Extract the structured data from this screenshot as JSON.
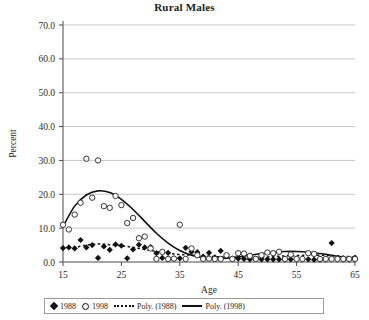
{
  "chart_data": {
    "type": "scatter",
    "title": "Rural Males",
    "xlabel": "Age",
    "ylabel": "Percent",
    "xlim": [
      15,
      65
    ],
    "ylim": [
      0,
      70
    ],
    "xticks": [
      15,
      25,
      35,
      45,
      55,
      65
    ],
    "yticks": [
      "0.0",
      "10.0",
      "20.0",
      "30.0",
      "40.0",
      "50.0",
      "60.0",
      "70.0"
    ],
    "grid": "horizontal",
    "legend_position": "bottom",
    "legend": [
      {
        "label": "1988",
        "marker": "filled-diamond"
      },
      {
        "label": "1998",
        "marker": "open-circle"
      },
      {
        "label": "Poly. (1988)",
        "marker": "dotted-line"
      },
      {
        "label": "Poly. (1998)",
        "marker": "solid-line"
      }
    ],
    "series": [
      {
        "name": "1988",
        "marker": "filled-diamond",
        "x": [
          15,
          16,
          17,
          18,
          19,
          20,
          21,
          22,
          23,
          24,
          25,
          26,
          27,
          28,
          29,
          30,
          31,
          32,
          33,
          34,
          35,
          36,
          37,
          38,
          39,
          40,
          41,
          42,
          43,
          44,
          45,
          46,
          47,
          48,
          49,
          50,
          51,
          52,
          53,
          54,
          55,
          56,
          57,
          58,
          59,
          60,
          61,
          62,
          63,
          64,
          65
        ],
        "y": [
          4.1,
          4.3,
          4.0,
          6.5,
          4.3,
          5.0,
          1.2,
          4.6,
          3.6,
          5.2,
          4.8,
          1.1,
          3.7,
          5.1,
          4.3,
          4.4,
          2.6,
          1.2,
          2.7,
          1.0,
          1.1,
          4.2,
          3.0,
          2.9,
          1.6,
          2.7,
          1.4,
          3.3,
          1.7,
          1.0,
          1.0,
          0.9,
          0.8,
          0.9,
          0.8,
          0.8,
          0.8,
          0.8,
          0.8,
          0.8,
          0.8,
          0.8,
          0.8,
          0.7,
          0.7,
          0.8,
          5.6,
          0.8,
          0.8,
          0.8,
          1.3
        ]
      },
      {
        "name": "1998",
        "marker": "open-circle",
        "x": [
          15,
          16,
          17,
          18,
          19,
          20,
          21,
          22,
          23,
          24,
          25,
          26,
          27,
          28,
          29,
          30,
          31,
          32,
          33,
          34,
          35,
          36,
          37,
          38,
          39,
          40,
          41,
          42,
          43,
          44,
          45,
          46,
          47,
          48,
          49,
          50,
          51,
          52,
          53,
          54,
          55,
          56,
          57,
          58,
          59,
          60,
          61,
          62,
          63,
          64,
          65
        ],
        "y": [
          11.0,
          9.6,
          14.0,
          17.5,
          30.5,
          19.0,
          30.0,
          16.5,
          16.0,
          19.5,
          16.8,
          11.5,
          13.0,
          7.0,
          7.5,
          4.0,
          0.9,
          3.0,
          0.9,
          1.0,
          11.0,
          0.9,
          4.0,
          2.0,
          0.9,
          1.0,
          0.9,
          0.9,
          2.0,
          0.9,
          2.6,
          2.5,
          1.8,
          0.9,
          2.0,
          2.8,
          2.6,
          3.0,
          0.9,
          2.2,
          0.9,
          0.9,
          2.6,
          2.4,
          0.9,
          0.9,
          0.9,
          0.9,
          0.9,
          0.9,
          0.9
        ]
      }
    ],
    "trendlines": [
      {
        "name": "Poly. (1988)",
        "style": "dotted",
        "x": [
          15,
          17,
          19,
          21,
          23,
          25,
          27,
          29,
          31,
          33,
          35,
          37,
          39,
          41,
          43,
          45,
          47,
          49,
          51,
          53,
          55,
          57,
          59,
          61,
          63,
          65
        ],
        "y": [
          4.2,
          4.3,
          5.0,
          5.3,
          5.1,
          4.8,
          4.3,
          3.7,
          3.1,
          2.6,
          2.2,
          2.0,
          1.8,
          1.6,
          1.4,
          1.3,
          1.3,
          1.4,
          1.6,
          1.8,
          1.9,
          2.0,
          2.0,
          1.9,
          1.7,
          1.4
        ]
      },
      {
        "name": "Poly. (1998)",
        "style": "solid",
        "x": [
          15,
          17,
          19,
          21,
          23,
          25,
          27,
          29,
          31,
          33,
          35,
          37,
          39,
          41,
          43,
          45,
          47,
          49,
          51,
          53,
          55,
          57,
          59,
          61,
          63,
          65
        ],
        "y": [
          10.5,
          16.5,
          19.8,
          21.0,
          20.5,
          18.5,
          15.5,
          12.0,
          8.5,
          5.6,
          3.4,
          2.0,
          1.2,
          1.0,
          1.1,
          1.5,
          2.0,
          2.5,
          2.9,
          3.1,
          3.1,
          2.9,
          2.5,
          2.0,
          1.4,
          0.9
        ]
      }
    ]
  }
}
